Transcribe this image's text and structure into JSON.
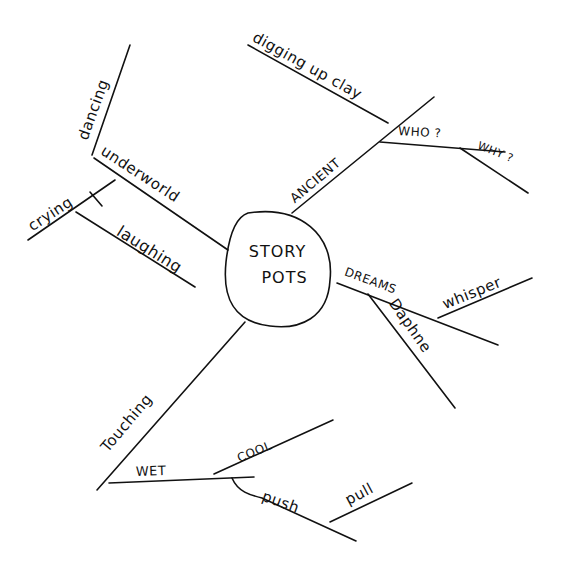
{
  "mindmap": {
    "center": {
      "line1": "STORY",
      "line2": "POTS"
    },
    "branches": {
      "ancient": {
        "label": "ANCIENT",
        "children": {
          "digging": "digging up clay",
          "who": "WHO ?",
          "why": "WHY ?"
        }
      },
      "underworld": {
        "label": "underworld",
        "children": {
          "dancing": "dancing",
          "crying": "crying",
          "laughing": "laughing"
        }
      },
      "dreams": {
        "label": "DREAMS",
        "children": {
          "whisper": "whisper",
          "daphne": "Daphne"
        }
      },
      "touching": {
        "label": "Touching",
        "children": {
          "wet": "WET",
          "cool": "COOL",
          "push": "push",
          "pull": "pull"
        }
      }
    },
    "colors": {
      "ink": "#111111",
      "paper": "#ffffff"
    }
  }
}
